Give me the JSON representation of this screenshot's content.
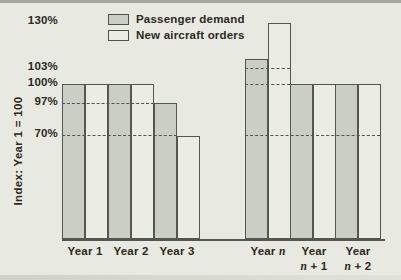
{
  "chart_data": {
    "type": "bar",
    "title": "",
    "ylabel": "Index: Year 1 = 100",
    "note": "vertical scale is illustrative, not linear",
    "legend": [
      {
        "name": "Passenger demand",
        "color": "#cbcec5",
        "swatch": "dark-gray"
      },
      {
        "name": "New aircraft orders",
        "color": "#ebede5",
        "swatch": "light-gray"
      }
    ],
    "categories": [
      "Year 1",
      "Year 2",
      "Year 3",
      "Year n",
      "Year n + 1",
      "Year n + 2"
    ],
    "series": [
      {
        "name": "Passenger demand",
        "values": [
          100,
          100,
          97,
          103,
          100,
          100
        ]
      },
      {
        "name": "New aircraft orders",
        "values": [
          100,
          100,
          70,
          130,
          100,
          100
        ]
      }
    ],
    "yticks": [
      "130%",
      "103%",
      "100%",
      "97%",
      "70%"
    ],
    "gridlines": {
      "style": "dashed",
      "levels": [
        "103%",
        "100%",
        "97%",
        "70%"
      ]
    },
    "legend_position": "top-center",
    "x_label_lines": [
      [
        "Year 1"
      ],
      [
        "Year 2"
      ],
      [
        "Year 3"
      ],
      [
        "Year *n*"
      ],
      [
        "Year",
        "*n* + 1"
      ],
      [
        "Year",
        "*n* + 2"
      ]
    ]
  },
  "colors": {
    "background": "#e8e9e1",
    "demand_bar": "#cbcec5",
    "orders_bar": "#ebede5",
    "line": "#54574e",
    "text": "#2a2a22"
  }
}
